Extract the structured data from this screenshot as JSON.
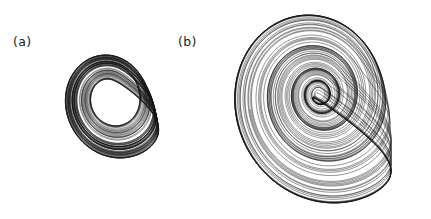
{
  "figure": {
    "background_color": "#ffffff",
    "line_color": "#141414",
    "width": 431,
    "height": 219
  },
  "panels": [
    {
      "id": "a",
      "label": "(a)",
      "caption_text": "(a)"
    },
    {
      "id": "b",
      "label": "(b)",
      "caption_text": "(b)"
    }
  ],
  "chart_data": [
    {
      "type": "line",
      "subtype": "phase-portrait",
      "panel": "a",
      "title": "(a)",
      "xlabel": "",
      "ylabel": "",
      "legend": [],
      "grid": false,
      "axes_visible": false,
      "description": "Spiral-type chaotic attractor projected onto a plane; trajectory winds outward from a dense dark core into nested loops, with a folded funnel region on the right side.",
      "system": "Roessler-type continuous flow",
      "parameters": {
        "a": 0.2,
        "b": 0.2,
        "c": 4.6
      },
      "initial_condition": [
        1.0,
        1.0,
        0.2
      ],
      "integration": {
        "dt": 0.01,
        "steps": 42000,
        "transient_skipped": 3000
      },
      "projection": {
        "x_axis": "x",
        "y_axis": "y"
      },
      "xlim": [
        -7.5,
        9.0
      ],
      "ylim": [
        -8.0,
        7.0
      ],
      "core_density": "high",
      "n_visible_loops": 16,
      "pixel_extent": {
        "x0": 58,
        "y0": 55,
        "x1": 165,
        "y1": 158
      }
    },
    {
      "type": "line",
      "subtype": "phase-portrait",
      "panel": "b",
      "title": "(b)",
      "xlabel": "",
      "ylabel": "",
      "legend": [],
      "grid": false,
      "axes_visible": false,
      "description": "Funnel-type chaotic attractor projected onto a plane; a hollow central hole is surrounded by widely spaced nested loops, with a dense cross-hatched folding band on the right.",
      "system": "Roessler-type continuous flow",
      "parameters": {
        "a": 0.2,
        "b": 0.2,
        "c": 9.0
      },
      "initial_condition": [
        1.0,
        1.0,
        0.2
      ],
      "integration": {
        "dt": 0.01,
        "steps": 52000,
        "transient_skipped": 4000
      },
      "projection": {
        "x_axis": "x",
        "y_axis": "y"
      },
      "xlim": [
        -13.0,
        16.0
      ],
      "ylim": [
        -15.0,
        11.0
      ],
      "core_density": "hollow",
      "n_visible_loops": 22,
      "pixel_extent": {
        "x0": 205,
        "y0": 15,
        "x1": 420,
        "y1": 202
      }
    }
  ]
}
